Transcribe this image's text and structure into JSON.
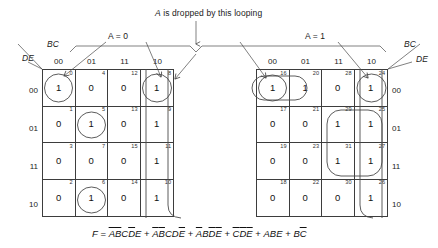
{
  "annotations": {
    "drop_note": "A is dropped by this looping",
    "a_zero": "A = 0",
    "a_one": "A = 1"
  },
  "axis": {
    "bc_label": "BC",
    "de_label": "DE",
    "col_headers": [
      "00",
      "01",
      "11",
      "10"
    ],
    "row_headers": [
      "00",
      "01",
      "11",
      "10"
    ]
  },
  "maps": [
    {
      "id": "left-map",
      "title": "A = 0",
      "cells": [
        [
          {
            "m": "0",
            "v": "1"
          },
          {
            "m": "4",
            "v": "0"
          },
          {
            "m": "12",
            "v": "0"
          },
          {
            "m": "8",
            "v": "1"
          }
        ],
        [
          {
            "m": "1",
            "v": "0"
          },
          {
            "m": "5",
            "v": "1"
          },
          {
            "m": "13",
            "v": "0"
          },
          {
            "m": "9",
            "v": "1"
          }
        ],
        [
          {
            "m": "3",
            "v": "0"
          },
          {
            "m": "7",
            "v": "0"
          },
          {
            "m": "15",
            "v": "0"
          },
          {
            "m": "11",
            "v": "1"
          }
        ],
        [
          {
            "m": "2",
            "v": "0"
          },
          {
            "m": "6",
            "v": "1"
          },
          {
            "m": "14",
            "v": "0"
          },
          {
            "m": "10",
            "v": "1"
          }
        ]
      ]
    },
    {
      "id": "right-map",
      "title": "A = 1",
      "cells": [
        [
          {
            "m": "16",
            "v": "1"
          },
          {
            "m": "20",
            "v": "1"
          },
          {
            "m": "28",
            "v": "0"
          },
          {
            "m": "24",
            "v": "1"
          }
        ],
        [
          {
            "m": "17",
            "v": "0"
          },
          {
            "m": "21",
            "v": "0"
          },
          {
            "m": "29",
            "v": "1"
          },
          {
            "m": "25",
            "v": "1"
          }
        ],
        [
          {
            "m": "19",
            "v": "0"
          },
          {
            "m": "23",
            "v": "0"
          },
          {
            "m": "31",
            "v": "1"
          },
          {
            "m": "27",
            "v": "1"
          }
        ],
        [
          {
            "m": "18",
            "v": "0"
          },
          {
            "m": "22",
            "v": "0"
          },
          {
            "m": "30",
            "v": "0"
          },
          {
            "m": "26",
            "v": "1"
          }
        ]
      ]
    }
  ],
  "equation": {
    "lhs": "F",
    "terms": [
      {
        "literals": [
          {
            "v": "A",
            "bar": true
          },
          {
            "v": "B",
            "bar": true
          },
          {
            "v": "C",
            "bar": false
          },
          {
            "v": "D",
            "bar": true
          },
          {
            "v": "E",
            "bar": false
          }
        ]
      },
      {
        "literals": [
          {
            "v": "A",
            "bar": true
          },
          {
            "v": "B",
            "bar": true
          },
          {
            "v": "C",
            "bar": false
          },
          {
            "v": "D",
            "bar": false
          },
          {
            "v": "E",
            "bar": true
          }
        ]
      },
      {
        "literals": [
          {
            "v": "A",
            "bar": true
          },
          {
            "v": "B",
            "bar": false
          },
          {
            "v": "D",
            "bar": true
          },
          {
            "v": "E",
            "bar": true
          }
        ]
      },
      {
        "literals": [
          {
            "v": "C",
            "bar": true
          },
          {
            "v": "D",
            "bar": true
          },
          {
            "v": "E",
            "bar": true
          }
        ]
      },
      {
        "literals": [
          {
            "v": "A",
            "bar": false
          },
          {
            "v": "B",
            "bar": false
          },
          {
            "v": "E",
            "bar": false
          }
        ]
      },
      {
        "literals": [
          {
            "v": "B",
            "bar": false
          },
          {
            "v": "C",
            "bar": true
          }
        ]
      }
    ]
  },
  "colors": {
    "ink": "#1a1a1a",
    "rule": "#3d3d3d",
    "loop": "#4a4a4a"
  }
}
